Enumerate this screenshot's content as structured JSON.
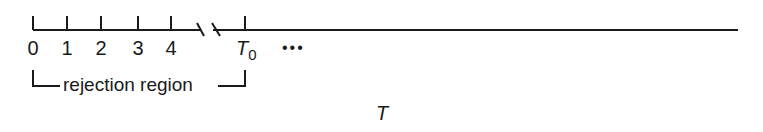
{
  "diagram": {
    "type": "number-line",
    "ticks": [
      {
        "label": "0",
        "x": 33
      },
      {
        "label": "1",
        "x": 67
      },
      {
        "label": "2",
        "x": 101
      },
      {
        "label": "3",
        "x": 138
      },
      {
        "label": "4",
        "x": 171
      }
    ],
    "threshold": {
      "symbol": "T",
      "subscript": "0",
      "x": 245
    },
    "continuation": "•••",
    "region_label": "rejection region",
    "axis_variable": "T",
    "colors": {
      "ink": "#1a1a1a",
      "background": "#ffffff"
    }
  }
}
